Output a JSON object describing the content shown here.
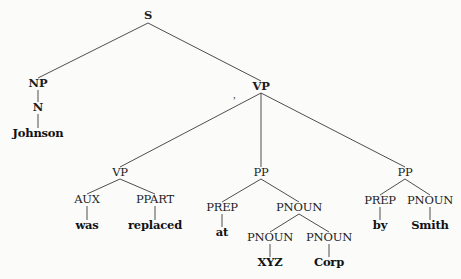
{
  "diagram": {
    "type": "parse-tree",
    "nodes": {
      "s": {
        "label": "S",
        "x": 148,
        "y": 16
      },
      "np": {
        "label": "NP",
        "x": 38,
        "y": 84
      },
      "n": {
        "label": "N",
        "x": 38,
        "y": 108
      },
      "johnson": {
        "label": "Johnson",
        "x": 38,
        "y": 134
      },
      "vp_top": {
        "label": "VP",
        "x": 261,
        "y": 87
      },
      "vp_low": {
        "label": "VP",
        "x": 120,
        "y": 173
      },
      "aux": {
        "label": "AUX",
        "x": 87,
        "y": 200
      },
      "ppart": {
        "label": "PPART",
        "x": 155,
        "y": 200
      },
      "was": {
        "label": "was",
        "x": 87,
        "y": 226
      },
      "replaced": {
        "label": "replaced",
        "x": 155,
        "y": 226
      },
      "pp_mid": {
        "label": "PP",
        "x": 261,
        "y": 173
      },
      "prep_at": {
        "label": "PREP",
        "x": 222,
        "y": 208
      },
      "at": {
        "label": "at",
        "x": 222,
        "y": 233
      },
      "pnoun_mid": {
        "label": "PNOUN",
        "x": 299,
        "y": 208
      },
      "pnoun_xyz": {
        "label": "PNOUN",
        "x": 270,
        "y": 238
      },
      "xyz": {
        "label": "XYZ",
        "x": 270,
        "y": 263
      },
      "pnoun_corp": {
        "label": "PNOUN",
        "x": 329,
        "y": 238
      },
      "corp": {
        "label": "Corp",
        "x": 329,
        "y": 263
      },
      "pp_right": {
        "label": "PP",
        "x": 405,
        "y": 173
      },
      "prep_by": {
        "label": "PREP",
        "x": 380,
        "y": 201
      },
      "by": {
        "label": "by",
        "x": 380,
        "y": 226
      },
      "pnoun_smith": {
        "label": "PNOUN",
        "x": 430,
        "y": 201
      },
      "smith": {
        "label": "Smith",
        "x": 430,
        "y": 226
      }
    },
    "edges": [
      [
        "s",
        "np"
      ],
      [
        "s",
        "vp_top"
      ],
      [
        "np",
        "n"
      ],
      [
        "n",
        "johnson"
      ],
      [
        "vp_top",
        "vp_low"
      ],
      [
        "vp_top",
        "pp_mid"
      ],
      [
        "vp_top",
        "pp_right"
      ],
      [
        "vp_low",
        "aux"
      ],
      [
        "vp_low",
        "ppart"
      ],
      [
        "aux",
        "was"
      ],
      [
        "ppart",
        "replaced"
      ],
      [
        "pp_mid",
        "prep_at"
      ],
      [
        "pp_mid",
        "pnoun_mid"
      ],
      [
        "prep_at",
        "at"
      ],
      [
        "pnoun_mid",
        "pnoun_xyz"
      ],
      [
        "pnoun_mid",
        "pnoun_corp"
      ],
      [
        "pnoun_xyz",
        "xyz"
      ],
      [
        "pnoun_corp",
        "corp"
      ],
      [
        "pp_right",
        "prep_by"
      ],
      [
        "pp_right",
        "pnoun_smith"
      ],
      [
        "prep_by",
        "by"
      ],
      [
        "pnoun_smith",
        "smith"
      ]
    ],
    "sentence": "Johnson was replaced at XYZ Corp by Smith"
  },
  "colors": {
    "background": "#fbfbfa",
    "ink": "#1c1c1c",
    "edge": "#3a3a3a",
    "bleed_through": "#d6d6d3"
  }
}
